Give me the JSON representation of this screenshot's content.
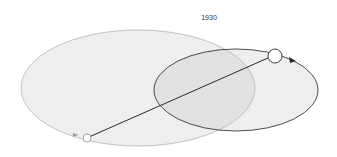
{
  "diagram": {
    "title": "1930",
    "colors": {
      "background": "#ffffff",
      "large_ellipse_fill": "#ebebeb",
      "large_ellipse_stroke": "#b4b4b4",
      "orbit_stroke": "#3a3a3a",
      "connector_line": "#2a2a2a",
      "node_fill": "#ffffff"
    },
    "shapes": {
      "large_ellipse": {
        "cx": 138,
        "cy": 88,
        "rx": 117,
        "ry": 58
      },
      "orbit_ellipse": {
        "cx": 236,
        "cy": 90,
        "rx": 82,
        "ry": 41
      },
      "large_node": {
        "cx": 275,
        "cy": 56,
        "r": 7
      },
      "small_node": {
        "cx": 87,
        "cy": 138,
        "r": 4
      },
      "connector": {
        "x1": 89,
        "y1": 137,
        "x2": 268,
        "y2": 58
      }
    }
  }
}
